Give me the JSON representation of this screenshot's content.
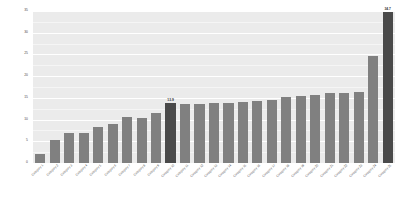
{
  "chart_data": {
    "type": "bar",
    "title": "",
    "xlabel": "",
    "ylabel": "",
    "ylim": [
      0,
      35
    ],
    "grid": true,
    "legend": "none",
    "yticks": [
      "0",
      "5",
      "10",
      "15",
      "20",
      "25",
      "30",
      "35"
    ],
    "bar_color": "#808080",
    "highlight_color": "#4a4a4a",
    "panel_background": "#ebebeb",
    "gridline_color": "#ffffff",
    "categories": [
      "Category 1",
      "Category 2",
      "Category 3",
      "Category 4",
      "Category 5",
      "Category 6",
      "Category 7",
      "Category 8",
      "Category 9",
      "Category 10",
      "Category 11",
      "Category 12",
      "Category 13",
      "Category 14",
      "Category 15",
      "Category 16",
      "Category 17",
      "Category 18",
      "Category 19",
      "Category 20",
      "Category 21",
      "Category 22",
      "Category 23",
      "Category 24",
      "Category 25"
    ],
    "values": [
      2.0,
      5.2,
      6.8,
      6.9,
      8.3,
      8.9,
      10.6,
      10.4,
      11.5,
      13.9,
      13.6,
      13.7,
      13.8,
      13.9,
      14.0,
      14.2,
      14.5,
      15.2,
      15.4,
      15.6,
      16.1,
      16.2,
      16.3,
      24.6,
      34.7
    ],
    "highlighted_indices": [
      9,
      24
    ],
    "data_labels": [
      {
        "index": 9,
        "text": "13.9"
      },
      {
        "index": 24,
        "text": "34.7"
      }
    ]
  }
}
